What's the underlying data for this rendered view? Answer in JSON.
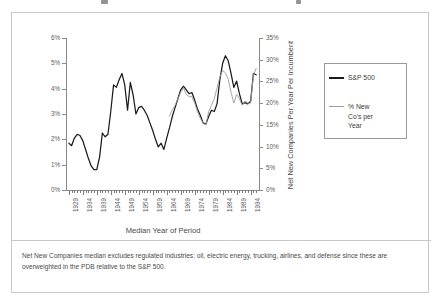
{
  "figure": {
    "axis_title_x": "Median Year of Period",
    "axis_title_y_right": "Net New Companies Per Year Per Incumbent",
    "footnote": "Net New Companies median excludes regulated industries: oil, electric energy, trucking, airlines, and defense since these are overweighted in the PDB relative to the S&P 500."
  },
  "legend": {
    "entry_1": "S&P 500",
    "entry_2": "% New\nCo's per\nYear",
    "color_1": "#1b1b1b",
    "color_2": "#9d9d9d"
  },
  "chart_data": {
    "type": "line",
    "title": "",
    "xlabel": "Median Year of Period",
    "ylabel": "",
    "ylabel_right": "Net New Companies Per Year Per Incumbent",
    "grid": false,
    "legend_position": "right",
    "xlim": [
      1928,
      1997
    ],
    "ylim": [
      0,
      6
    ],
    "ylim_right": [
      0,
      35
    ],
    "ytick_labels": [
      "0%",
      "1%",
      "2%",
      "3%",
      "4%",
      "5%",
      "6%"
    ],
    "ytick_values": [
      0,
      1,
      2,
      3,
      4,
      5,
      6
    ],
    "ytick_labels_right": [
      "0%",
      "5%",
      "10%",
      "15%",
      "20%",
      "25%",
      "30%",
      "35%"
    ],
    "ytick_values_right": [
      0,
      5,
      10,
      15,
      20,
      25,
      30,
      35
    ],
    "xtick_labels": [
      "1929",
      "1934",
      "1939",
      "1944",
      "1949",
      "1954",
      "1959",
      "1964",
      "1969",
      "1974",
      "1979",
      "1984",
      "1989",
      "1994"
    ],
    "xtick_values": [
      1929,
      1934,
      1939,
      1944,
      1949,
      1954,
      1959,
      1964,
      1969,
      1974,
      1979,
      1984,
      1989,
      1994
    ],
    "series": [
      {
        "name": "S&P 500",
        "axis": "left",
        "units": "percent",
        "color": "#1b1b1b",
        "x": [
          1929,
          1930,
          1931,
          1932,
          1933,
          1934,
          1935,
          1936,
          1937,
          1938,
          1939,
          1940,
          1941,
          1942,
          1943,
          1944,
          1945,
          1946,
          1947,
          1948,
          1949,
          1950,
          1951,
          1952,
          1953,
          1954,
          1955,
          1956,
          1957,
          1958,
          1959,
          1960,
          1961,
          1962,
          1963,
          1964,
          1965,
          1966,
          1967,
          1968,
          1969,
          1970,
          1971,
          1972,
          1973,
          1974,
          1975,
          1976,
          1977,
          1978,
          1979,
          1980,
          1981,
          1982,
          1983,
          1984,
          1985,
          1986,
          1987,
          1988,
          1989,
          1990,
          1991,
          1992,
          1993,
          1994,
          1995,
          1996
        ],
        "values": [
          1.85,
          1.75,
          2.05,
          2.2,
          2.15,
          1.95,
          1.6,
          1.25,
          0.95,
          0.8,
          0.8,
          1.3,
          2.25,
          2.1,
          2.2,
          3.1,
          4.15,
          4.05,
          4.35,
          4.6,
          4.15,
          3.15,
          4.25,
          3.75,
          3.0,
          3.25,
          3.3,
          3.15,
          2.95,
          2.65,
          2.35,
          2.0,
          1.7,
          1.85,
          1.6,
          2.05,
          2.45,
          2.9,
          3.25,
          3.6,
          3.95,
          4.1,
          3.95,
          3.8,
          3.85,
          3.55,
          3.2,
          2.95,
          2.65,
          2.6,
          2.9,
          3.15,
          3.1,
          3.4,
          4.35,
          5.0,
          5.3,
          5.1,
          4.6,
          4.05,
          4.3,
          3.8,
          3.4,
          3.45,
          3.4,
          3.5,
          4.6,
          4.55
        ]
      },
      {
        "name": "% New Co's per Year",
        "axis": "right",
        "units": "percent",
        "color": "#9d9d9d",
        "x": [
          1965,
          1966,
          1967,
          1968,
          1969,
          1970,
          1971,
          1972,
          1973,
          1974,
          1975,
          1976,
          1977,
          1978,
          1979,
          1980,
          1981,
          1982,
          1983,
          1984,
          1985,
          1986,
          1987,
          1988,
          1989,
          1990,
          1991,
          1992,
          1993,
          1994,
          1995,
          1996
        ],
        "values": [
          17.0,
          18.5,
          19.5,
          21.0,
          22.5,
          23.5,
          22.0,
          21.5,
          21.5,
          20.0,
          18.0,
          16.5,
          15.5,
          15.0,
          18.0,
          19.5,
          21.0,
          23.5,
          26.0,
          27.5,
          27.0,
          25.5,
          22.5,
          20.0,
          22.0,
          21.0,
          19.5,
          20.5,
          20.0,
          20.0,
          26.5,
          28.0
        ]
      }
    ]
  }
}
